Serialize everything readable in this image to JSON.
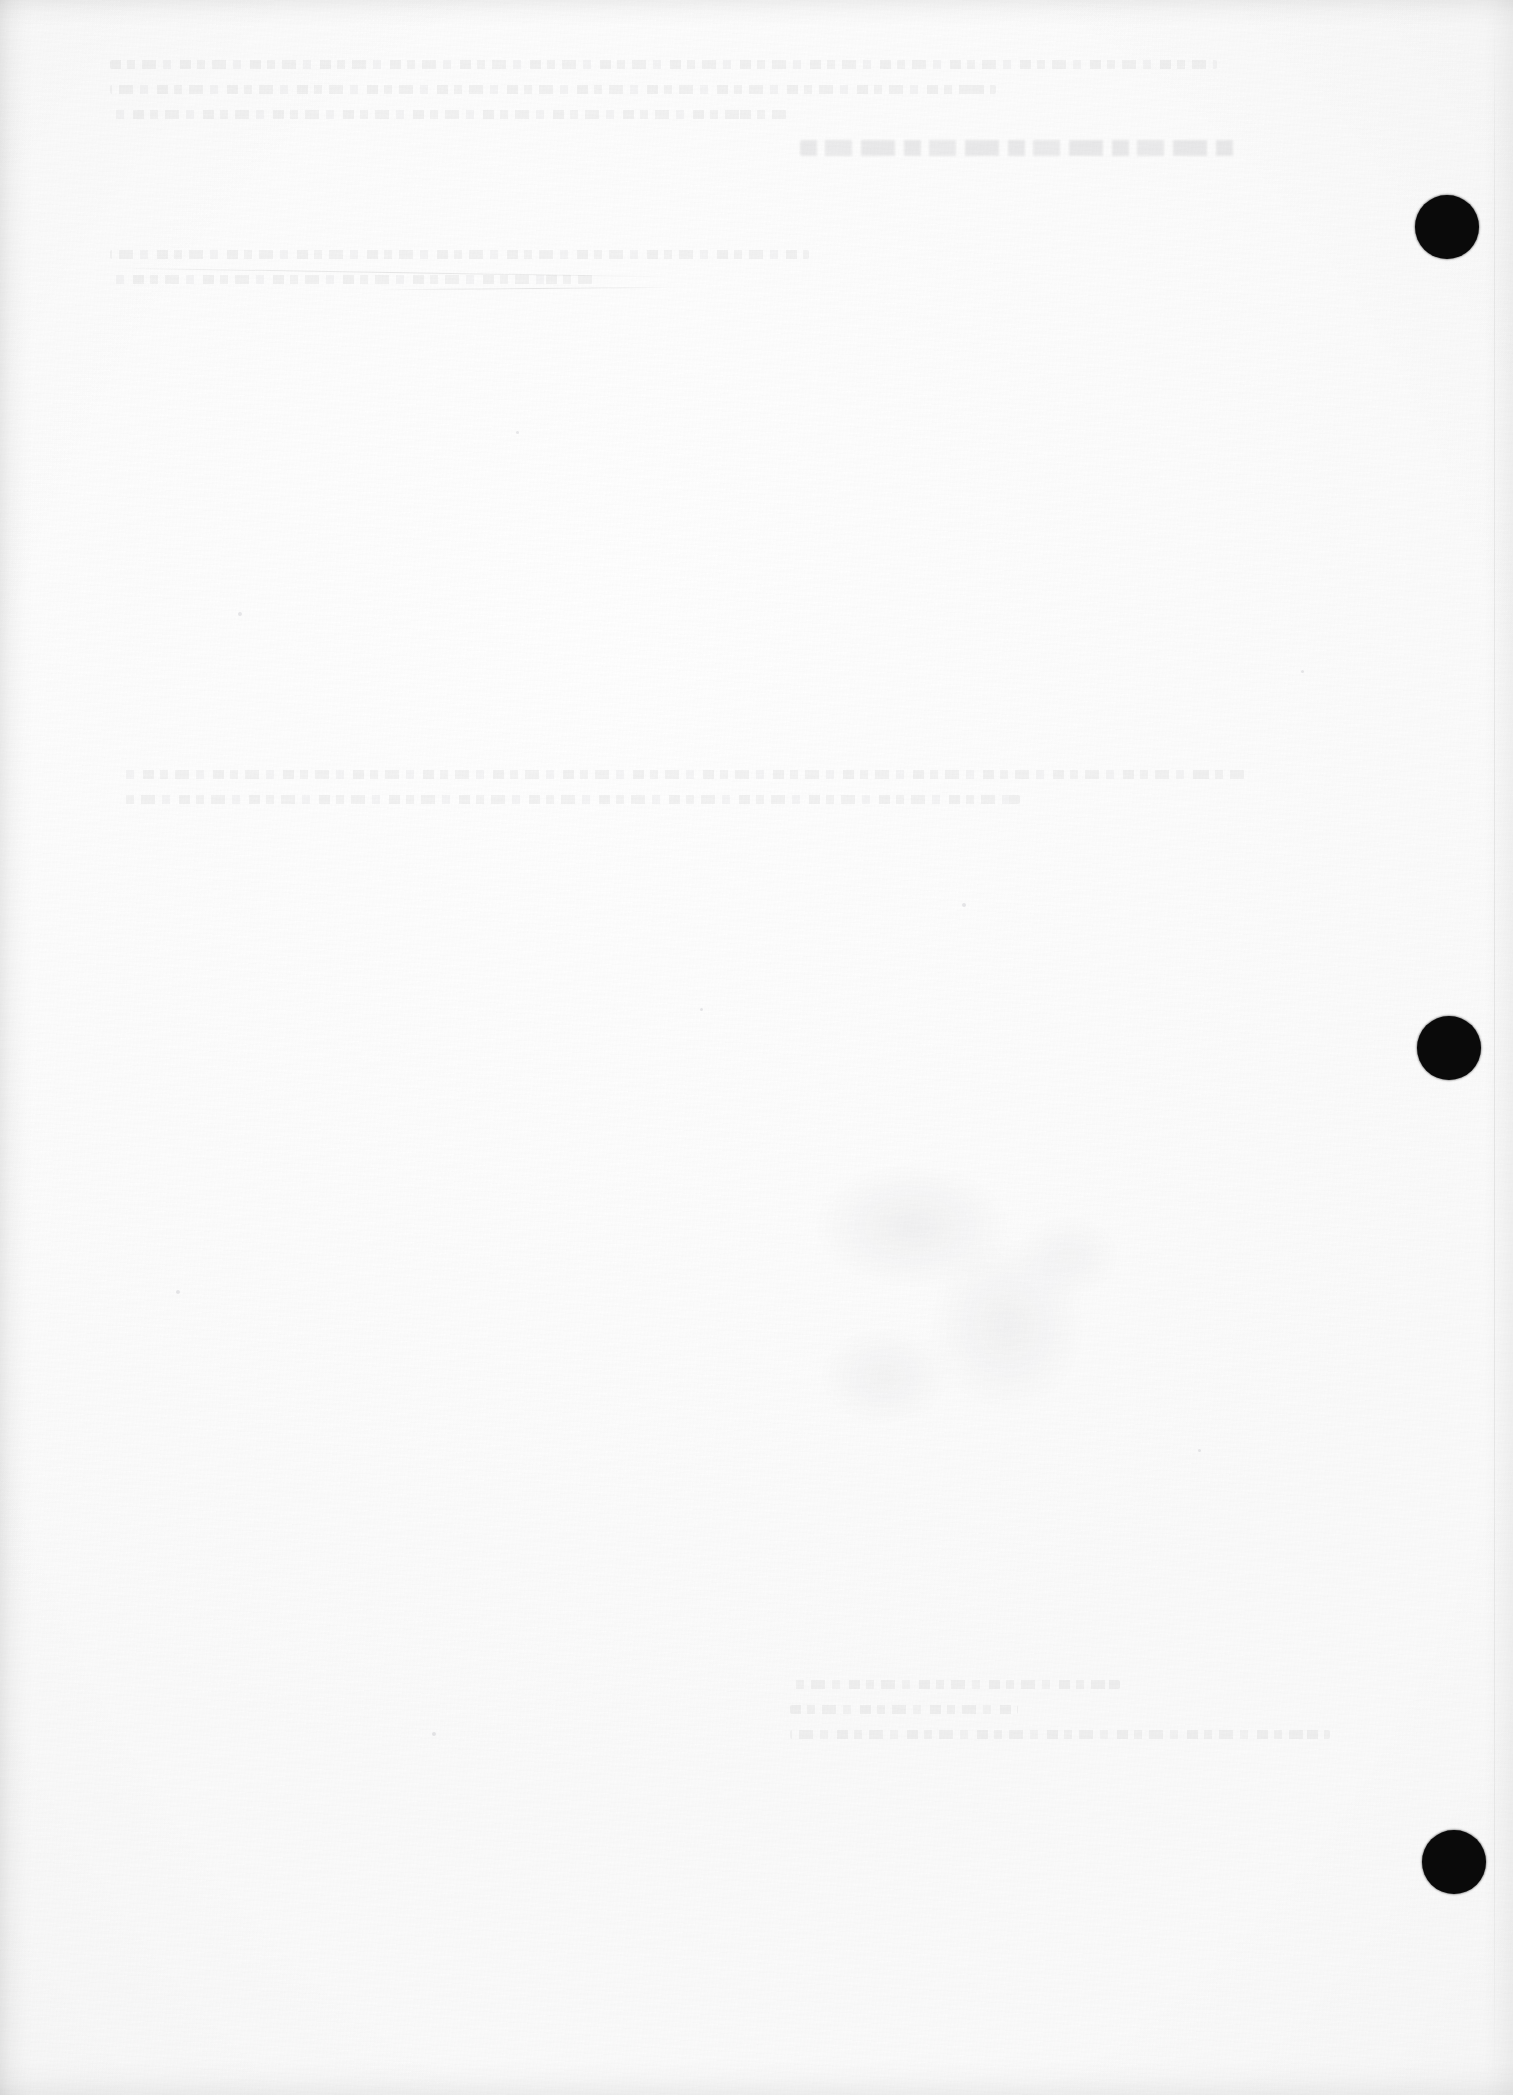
{
  "document": {
    "kind": "scanned-page",
    "page_state": "blank",
    "page_width": 1513,
    "page_height": 2095,
    "paper_color": "#fdfdfd",
    "ink_color": "#0a0a0a",
    "visible_text": "",
    "notes_label": ""
  },
  "margin_marks": {
    "label": "",
    "count": 3,
    "color": "#0a0a0a",
    "items": [
      {
        "name": "margin-mark-1",
        "x": 1415,
        "y": 195,
        "size": 64,
        "label": ""
      },
      {
        "name": "margin-mark-2",
        "x": 1417,
        "y": 1016,
        "size": 64,
        "label": ""
      },
      {
        "name": "margin-mark-3",
        "x": 1422,
        "y": 1830,
        "size": 64,
        "label": ""
      }
    ]
  },
  "show_through": {
    "label": "",
    "heading": {
      "x": 800,
      "y": 140,
      "width": 440,
      "label": ""
    },
    "blocks": [
      {
        "name": "ghost-block-header",
        "x": 110,
        "y": 60,
        "width": 1230,
        "lines": [
          "",
          "",
          ""
        ]
      },
      {
        "name": "ghost-block-upper",
        "x": 110,
        "y": 250,
        "width": 1270,
        "lines": [
          "",
          ""
        ]
      },
      {
        "name": "ghost-block-mid",
        "x": 120,
        "y": 770,
        "width": 1250,
        "lines": [
          "",
          ""
        ]
      },
      {
        "name": "ghost-block-lower",
        "x": 790,
        "y": 1680,
        "width": 600,
        "lines": [
          "",
          "",
          ""
        ]
      }
    ],
    "smudge": {
      "name": "ghost-smudge-figure",
      "x": 810,
      "y": 1160,
      "width": 340,
      "height": 300,
      "label": ""
    }
  },
  "artifacts": {
    "label": "",
    "scratches": [
      {
        "name": "scratch-diagonal-upper",
        "x": 110,
        "y": 272,
        "width": 560,
        "rotate": "0.9deg"
      },
      {
        "name": "scratch-diagonal-long",
        "x": 380,
        "y": 288,
        "width": 300,
        "rotate": "-0.5deg"
      }
    ],
    "specks": [
      {
        "x": 238,
        "y": 612,
        "size": 4
      },
      {
        "x": 516,
        "y": 431,
        "size": 3
      },
      {
        "x": 962,
        "y": 903,
        "size": 4
      },
      {
        "x": 1198,
        "y": 1449,
        "size": 3
      },
      {
        "x": 432,
        "y": 1732,
        "size": 4
      },
      {
        "x": 700,
        "y": 1008,
        "size": 3
      },
      {
        "x": 1301,
        "y": 670,
        "size": 3
      },
      {
        "x": 176,
        "y": 1290,
        "size": 4
      }
    ]
  }
}
